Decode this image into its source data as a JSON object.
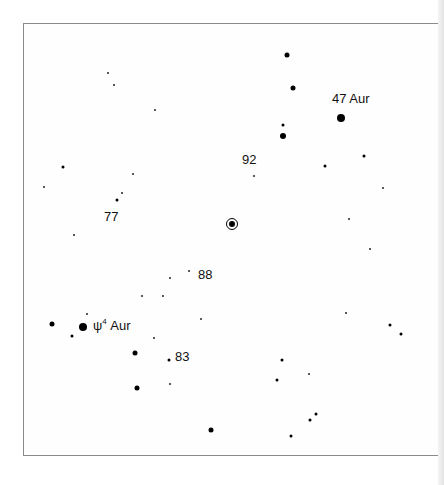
{
  "chart_data": {
    "type": "scatter",
    "title": "",
    "subtitle": "",
    "xlabel": "",
    "ylabel": "",
    "grid": false,
    "legend": null,
    "frame": {
      "left": 23,
      "top": 23,
      "right": 438,
      "bottom": 456
    },
    "target": {
      "x": 232,
      "y": 224,
      "symbol": "circled-dot"
    },
    "labels": [
      {
        "text": "47 Aur",
        "x": 332,
        "y": 98
      },
      {
        "text": "92",
        "x": 242,
        "y": 159
      },
      {
        "text": "77",
        "x": 104,
        "y": 216
      },
      {
        "text": "88",
        "x": 198,
        "y": 274
      },
      {
        "text": "ψ",
        "sup": "4",
        "suffix": " Aur",
        "x": 93,
        "y": 325
      },
      {
        "text": "83",
        "x": 175,
        "y": 356
      }
    ],
    "stars": [
      {
        "x": 287,
        "y": 55,
        "size": 3
      },
      {
        "x": 293,
        "y": 88,
        "size": 3
      },
      {
        "x": 108,
        "y": 73,
        "size": 1
      },
      {
        "x": 114,
        "y": 85,
        "size": 1
      },
      {
        "x": 155,
        "y": 110,
        "size": 1
      },
      {
        "x": 341,
        "y": 118,
        "size": 5
      },
      {
        "x": 283,
        "y": 125,
        "size": 2
      },
      {
        "x": 283,
        "y": 136,
        "size": 4
      },
      {
        "x": 364,
        "y": 156,
        "size": 2
      },
      {
        "x": 325,
        "y": 166,
        "size": 2
      },
      {
        "x": 63,
        "y": 167,
        "size": 2
      },
      {
        "x": 133,
        "y": 174,
        "size": 1
      },
      {
        "x": 254,
        "y": 176,
        "size": 1
      },
      {
        "x": 44,
        "y": 187,
        "size": 1
      },
      {
        "x": 383,
        "y": 188,
        "size": 1
      },
      {
        "x": 122,
        "y": 193,
        "size": 1
      },
      {
        "x": 117,
        "y": 200,
        "size": 2
      },
      {
        "x": 349,
        "y": 219,
        "size": 1
      },
      {
        "x": 74,
        "y": 235,
        "size": 1
      },
      {
        "x": 370,
        "y": 249,
        "size": 1
      },
      {
        "x": 189,
        "y": 271,
        "size": 1
      },
      {
        "x": 170,
        "y": 278,
        "size": 1
      },
      {
        "x": 142,
        "y": 296,
        "size": 1
      },
      {
        "x": 163,
        "y": 296,
        "size": 1
      },
      {
        "x": 346,
        "y": 313,
        "size": 1
      },
      {
        "x": 87,
        "y": 314,
        "size": 1
      },
      {
        "x": 201,
        "y": 319,
        "size": 1
      },
      {
        "x": 52,
        "y": 324,
        "size": 3
      },
      {
        "x": 390,
        "y": 325,
        "size": 2
      },
      {
        "x": 83,
        "y": 327,
        "size": 5
      },
      {
        "x": 401,
        "y": 334,
        "size": 2
      },
      {
        "x": 72,
        "y": 336,
        "size": 2
      },
      {
        "x": 154,
        "y": 338,
        "size": 1
      },
      {
        "x": 135,
        "y": 353,
        "size": 3
      },
      {
        "x": 169,
        "y": 360,
        "size": 2
      },
      {
        "x": 282,
        "y": 360,
        "size": 2
      },
      {
        "x": 309,
        "y": 374,
        "size": 1
      },
      {
        "x": 277,
        "y": 380,
        "size": 2
      },
      {
        "x": 170,
        "y": 384,
        "size": 1
      },
      {
        "x": 137,
        "y": 388,
        "size": 3
      },
      {
        "x": 316,
        "y": 414,
        "size": 2
      },
      {
        "x": 310,
        "y": 420,
        "size": 2
      },
      {
        "x": 211,
        "y": 430,
        "size": 3
      },
      {
        "x": 291,
        "y": 436,
        "size": 2
      }
    ]
  },
  "labels": {
    "aur47": "47 Aur",
    "n92": "92",
    "n77": "77",
    "n88": "88",
    "psi4_base": "ψ",
    "psi4_sup": "4",
    "psi4_suffix": " Aur",
    "n83": "83"
  }
}
